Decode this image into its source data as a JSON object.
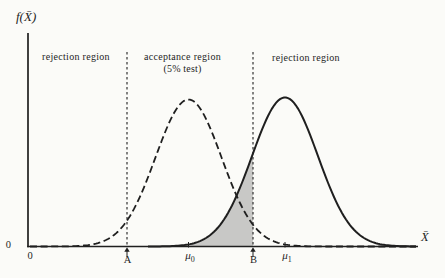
{
  "figure": {
    "background": "#fbfbf8",
    "ink": "#1f1f1f",
    "y_axis_label": "f(X̄)",
    "x_axis_label": "X̄",
    "y_origin_label": "0",
    "x_origin_label": "0",
    "regions": {
      "left_label": "rejection region",
      "middle_label_line1": "acceptance region",
      "middle_label_line2": "(5% test)",
      "right_label": "rejection region"
    },
    "points": {
      "a_label": "A",
      "b_label": "B",
      "mu0_base": "μ",
      "mu0_sub": "0",
      "mu1_base": "μ",
      "mu1_sub": "1"
    }
  },
  "chart_data": {
    "type": "line",
    "xlabel": "X̄",
    "ylabel": "f(X̄)",
    "x_tick_labels": [
      "0",
      "A",
      "μ0",
      "B",
      "μ1"
    ],
    "grid": false,
    "legend": null,
    "axes": {
      "y_axis_x_px": 28,
      "y_axis_top_px": 33,
      "x_axis_y_px": 246.5,
      "x_axis_left_px": 28,
      "x_axis_right_px": 418
    },
    "series": [
      {
        "name": "sampling distribution of X̄ under H0 (centered at μ0)",
        "style": "dashed",
        "shape": "normal",
        "center_px": 188.5,
        "sigma_px": 33,
        "peak_height_px": 147,
        "x_start_px": 30,
        "x_end_px": 416
      },
      {
        "name": "sampling distribution of X̄ under H1 (centered at μ1)",
        "style": "solid",
        "shape": "normal",
        "center_px": 285,
        "sigma_px": 33,
        "peak_height_px": 149,
        "x_start_px": 148,
        "x_end_px": 416
      }
    ],
    "shaded_region": {
      "description": "area under the solid μ1 curve to the left of B (Type II error probability)",
      "under_series": 1,
      "from_px": 148,
      "to_px": 253,
      "fill": "#c8c8c6"
    },
    "decision_points": {
      "A_px": 127,
      "B_px": 253,
      "mu0_px": 188.5,
      "mu1_px": 285,
      "boundary_line_top_px": 52,
      "boundary_line_bottom_px": 246.5
    }
  }
}
